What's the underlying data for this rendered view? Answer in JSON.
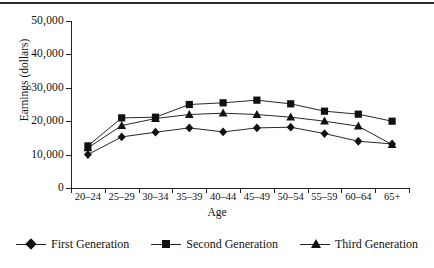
{
  "chart_data": {
    "type": "line",
    "title": "",
    "xlabel": "Age",
    "ylabel": "Earnings (dollars)",
    "categories": [
      "20–24",
      "25–29",
      "30–34",
      "35–39",
      "40–44",
      "45–49",
      "50–54",
      "55–59",
      "60–64",
      "65+"
    ],
    "ylim": [
      0,
      50000
    ],
    "yticks": [
      0,
      10000,
      20000,
      30000,
      40000,
      50000
    ],
    "ytick_labels": [
      "0",
      "10,000",
      "20,000",
      "30,000",
      "40,000",
      "50,000"
    ],
    "grid": false,
    "legend_position": "bottom",
    "series": [
      {
        "name": "First Generation",
        "marker": "diamond",
        "values": [
          10000,
          15300,
          16700,
          18000,
          16800,
          18000,
          18200,
          16300,
          14000,
          13200
        ]
      },
      {
        "name": "Second Generation",
        "marker": "square",
        "values": [
          12600,
          21000,
          21200,
          25000,
          25500,
          26300,
          25200,
          23000,
          22100,
          20000
        ]
      },
      {
        "name": "Third Generation",
        "marker": "triangle",
        "values": [
          12000,
          18700,
          20800,
          22000,
          22400,
          22000,
          21200,
          20000,
          18500,
          13000
        ]
      }
    ]
  },
  "legend": {
    "items": [
      {
        "label": "First Generation",
        "marker": "diamond"
      },
      {
        "label": "Second Generation",
        "marker": "square"
      },
      {
        "label": "Third Generation",
        "marker": "triangle"
      }
    ]
  },
  "colors": {
    "axis": "#222222",
    "series": "#111111",
    "background": "#ffffff",
    "rule": "#2b2b2b"
  }
}
